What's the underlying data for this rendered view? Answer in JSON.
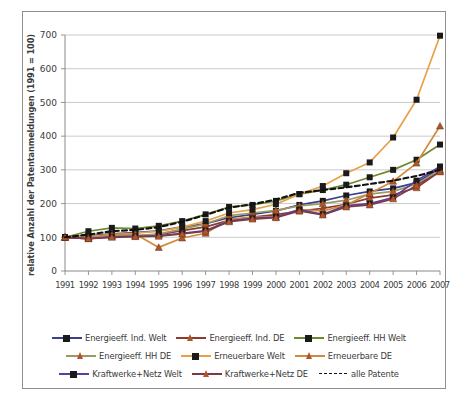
{
  "chart_data": {
    "type": "line",
    "title": "",
    "xlabel": "",
    "ylabel": "relative Anzahl der Patentanmeldungen (1991 = 100)",
    "ylim": [
      0,
      700
    ],
    "yticks": [
      0,
      100,
      200,
      300,
      400,
      500,
      600,
      700
    ],
    "grid": true,
    "legend_position": "bottom",
    "categories": [
      "1991",
      "1992",
      "1993",
      "1994",
      "1995",
      "1996",
      "1997",
      "1998",
      "1999",
      "2000",
      "2001",
      "2002",
      "2003",
      "2004",
      "2005",
      "2006",
      "2007"
    ],
    "series": [
      {
        "name": "Energieeff. Ind. Welt",
        "color": "#3a3f8f",
        "marker": "square",
        "marker_color": "#1a1a1a",
        "dash": false,
        "values": [
          100,
          104,
          110,
          114,
          119,
          131,
          140,
          158,
          168,
          178,
          196,
          208,
          224,
          236,
          245,
          262,
          305
        ]
      },
      {
        "name": "Energieeff. Ind. DE",
        "color": "#8e3b2e",
        "marker": "triangle",
        "marker_color": "#b1562a",
        "dash": false,
        "values": [
          100,
          96,
          103,
          104,
          108,
          120,
          131,
          150,
          160,
          167,
          178,
          186,
          198,
          216,
          226,
          247,
          296
        ]
      },
      {
        "name": "Energieeff. HH Welt",
        "color": "#6d8a2f",
        "marker": "square",
        "marker_color": "#1a1a1a",
        "dash": false,
        "values": [
          100,
          118,
          128,
          126,
          134,
          148,
          168,
          190,
          196,
          208,
          228,
          240,
          256,
          278,
          300,
          330,
          375
        ]
      },
      {
        "name": "Energieeff. HH DE",
        "color": "#9a9a62",
        "marker": "triangle",
        "marker_color": "#b1562a",
        "dash": false,
        "values": [
          100,
          98,
          104,
          104,
          110,
          124,
          140,
          164,
          172,
          180,
          193,
          200,
          210,
          228,
          236,
          258,
          300
        ]
      },
      {
        "name": "Erneuerbare Welt",
        "color": "#e8a04a",
        "marker": "square",
        "marker_color": "#1a1a1a",
        "dash": false,
        "values": [
          100,
          102,
          108,
          112,
          118,
          130,
          148,
          172,
          182,
          198,
          228,
          252,
          290,
          322,
          396,
          508,
          698
        ]
      },
      {
        "name": "Erneuerbare DE",
        "color": "#d08a3a",
        "marker": "triangle",
        "marker_color": "#b1562a",
        "dash": false,
        "values": [
          100,
          100,
          108,
          110,
          70,
          98,
          112,
          153,
          160,
          160,
          182,
          178,
          196,
          230,
          266,
          320,
          430
        ]
      },
      {
        "name": "Kraftwerke+Netz Welt",
        "color": "#5b3f9e",
        "marker": "square",
        "marker_color": "#1a1a1a",
        "dash": false,
        "values": [
          100,
          96,
          101,
          103,
          104,
          112,
          120,
          148,
          156,
          160,
          182,
          168,
          194,
          200,
          218,
          268,
          310
        ]
      },
      {
        "name": "Kraftwerke+Netz DE",
        "color": "#7a3a46",
        "marker": "triangle",
        "marker_color": "#b1562a",
        "dash": false,
        "values": [
          100,
          96,
          100,
          102,
          103,
          110,
          118,
          146,
          154,
          158,
          178,
          166,
          190,
          196,
          214,
          254,
          294
        ]
      },
      {
        "name": "alle Patente",
        "color": "#111111",
        "marker": "none",
        "marker_color": "#111111",
        "dash": true,
        "values": [
          100,
          108,
          118,
          122,
          130,
          146,
          166,
          188,
          198,
          212,
          232,
          240,
          248,
          258,
          268,
          282,
          300
        ]
      }
    ]
  },
  "legend": {
    "rows": [
      [
        {
          "label": "Energieeff. Ind. Welt",
          "color": "#3a3f8f",
          "marker": "square"
        },
        {
          "label": "Energieeff. Ind. DE",
          "color": "#8e3b2e",
          "marker": "triangle"
        },
        {
          "label": "Energieeff. HH Welt",
          "color": "#6d8a2f",
          "marker": "square"
        }
      ],
      [
        {
          "label": "Energieeff. HH DE",
          "color": "#9a9a62",
          "marker": "triangle"
        },
        {
          "label": "Erneuerbare Welt",
          "color": "#e8a04a",
          "marker": "square"
        },
        {
          "label": "Erneuerbare DE",
          "color": "#d08a3a",
          "marker": "triangle"
        }
      ],
      [
        {
          "label": "Kraftwerke+Netz Welt",
          "color": "#5b3f9e",
          "marker": "square"
        },
        {
          "label": "Kraftwerke+Netz DE",
          "color": "#7a3a46",
          "marker": "triangle"
        },
        {
          "label": "alle Patente",
          "color": "#111111",
          "marker": "dash"
        }
      ]
    ]
  }
}
